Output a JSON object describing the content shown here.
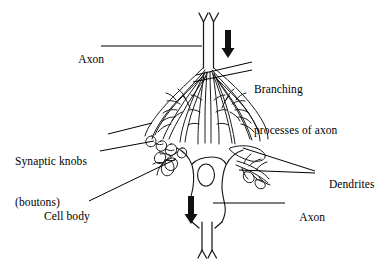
{
  "figure": {
    "style": "black-and-white line drawing",
    "stroke_color": "#000000",
    "background_color": "#ffffff",
    "width": 382,
    "height": 263
  },
  "labels": {
    "axon_top": "Axon",
    "branching_line1": "Branching",
    "branching_line2": "processes of axon",
    "synaptic_line1": "Synaptic knobs",
    "synaptic_line2": "(boutons)",
    "dendrites": "Dendrites",
    "cell_body": "Cell body",
    "axon_bottom": "Axon"
  },
  "parts": [
    {
      "name": "axon-top",
      "label": "Axon",
      "description": "incoming axon entering from top of figure, forked myelin tube"
    },
    {
      "name": "branching-processes",
      "label": "Branching processes of axon",
      "description": "terminal arborization flaring over the cell body"
    },
    {
      "name": "synaptic-knobs",
      "label": "Synaptic knobs (boutons)",
      "description": "bulbous terminal endings contacting the soma"
    },
    {
      "name": "dendrites",
      "label": "Dendrites",
      "description": "branched receiving processes on right of soma"
    },
    {
      "name": "cell-body",
      "label": "Cell body",
      "description": "soma containing the nucleus"
    },
    {
      "name": "axon-bottom",
      "label": "Axon",
      "description": "outgoing axon leaving the bottom of the soma"
    }
  ],
  "arrows": [
    {
      "name": "flow-arrow-top",
      "direction": "down",
      "x": 228,
      "y_top": 30,
      "y_bottom": 58
    },
    {
      "name": "flow-arrow-bottom",
      "direction": "down",
      "x": 191,
      "y_top": 196,
      "y_bottom": 224
    }
  ]
}
